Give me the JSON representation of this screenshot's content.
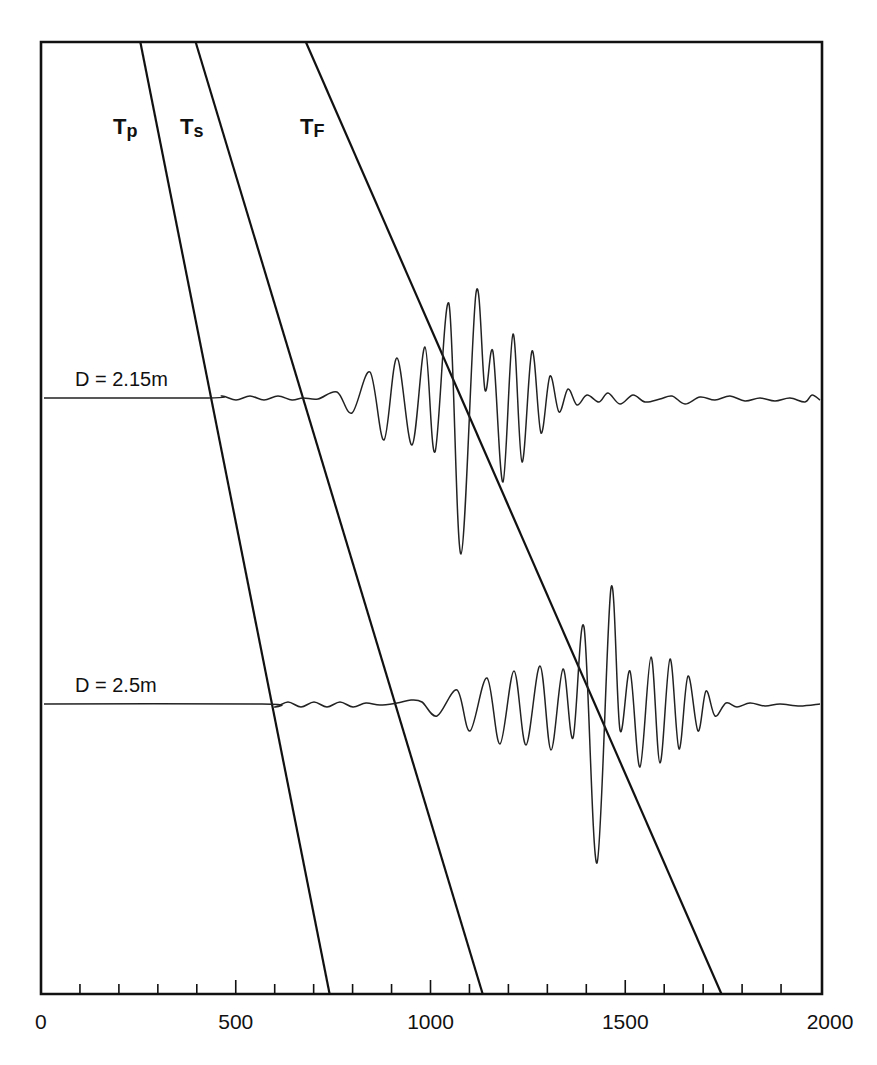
{
  "chart_data": {
    "type": "line",
    "title": "",
    "xlabel": "",
    "ylabel": "",
    "xlim": [
      0,
      2000
    ],
    "x_ticks": [
      0,
      500,
      1000,
      1500,
      2000
    ],
    "x_tick_labels": [
      "0",
      "500",
      "1000",
      "1500",
      "2000"
    ],
    "minor_tick_step": 100,
    "grid": false,
    "legend": null,
    "arrival_lines": [
      {
        "name": "Tp",
        "label_main": "T",
        "label_sub": "p",
        "x_top": 255,
        "x_bottom": 741
      },
      {
        "name": "Ts",
        "label_main": "T",
        "label_sub": "s",
        "x_top": 397,
        "x_bottom": 1134
      },
      {
        "name": "TF",
        "label_main": "T",
        "label_sub": "F",
        "x_top": 680,
        "x_bottom": 1747
      }
    ],
    "series": [
      {
        "name": "D = 2.15m",
        "label": "D = 2.15m",
        "baseline_px": 398,
        "points_px": [
          [
            44,
            398
          ],
          [
            208,
            398
          ],
          [
            222,
            396
          ],
          [
            236,
            400
          ],
          [
            250,
            396
          ],
          [
            264,
            400
          ],
          [
            278,
            396
          ],
          [
            292,
            400
          ],
          [
            303,
            398
          ],
          [
            318,
            399
          ],
          [
            337,
            392
          ],
          [
            352,
            413
          ],
          [
            370,
            372
          ],
          [
            384,
            440
          ],
          [
            397,
            358
          ],
          [
            412,
            445
          ],
          [
            425,
            347
          ],
          [
            435,
            452
          ],
          [
            449,
            304
          ],
          [
            461,
            554
          ],
          [
            476,
            293
          ],
          [
            485,
            390
          ],
          [
            493,
            352
          ],
          [
            503,
            482
          ],
          [
            513,
            334
          ],
          [
            522,
            462
          ],
          [
            532,
            351
          ],
          [
            541,
            433
          ],
          [
            550,
            376
          ],
          [
            559,
            412
          ],
          [
            568,
            389
          ],
          [
            577,
            405
          ],
          [
            587,
            395
          ],
          [
            599,
            402
          ],
          [
            608,
            393
          ],
          [
            620,
            404
          ],
          [
            633,
            395
          ],
          [
            645,
            402
          ],
          [
            660,
            399
          ],
          [
            672,
            396
          ],
          [
            685,
            404
          ],
          [
            700,
            397
          ],
          [
            715,
            400
          ],
          [
            730,
            396
          ],
          [
            745,
            401
          ],
          [
            760,
            398
          ],
          [
            775,
            401
          ],
          [
            790,
            398
          ],
          [
            805,
            402
          ],
          [
            812,
            395
          ],
          [
            820,
            400
          ]
        ]
      },
      {
        "name": "D = 2.5m",
        "label": "D = 2.5m",
        "baseline_px": 704,
        "points_px": [
          [
            44,
            704
          ],
          [
            262,
            704
          ],
          [
            275,
            707
          ],
          [
            288,
            702
          ],
          [
            301,
            707
          ],
          [
            314,
            702
          ],
          [
            327,
            707
          ],
          [
            340,
            702
          ],
          [
            353,
            707
          ],
          [
            366,
            703
          ],
          [
            380,
            705
          ],
          [
            397,
            703
          ],
          [
            411,
            700
          ],
          [
            422,
            702
          ],
          [
            437,
            716
          ],
          [
            457,
            690
          ],
          [
            470,
            731
          ],
          [
            487,
            678
          ],
          [
            500,
            744
          ],
          [
            514,
            671
          ],
          [
            526,
            745
          ],
          [
            540,
            666
          ],
          [
            551,
            750
          ],
          [
            563,
            669
          ],
          [
            573,
            738
          ],
          [
            584,
            627
          ],
          [
            597,
            863
          ],
          [
            611,
            588
          ],
          [
            620,
            730
          ],
          [
            630,
            671
          ],
          [
            640,
            767
          ],
          [
            651,
            657
          ],
          [
            660,
            763
          ],
          [
            670,
            659
          ],
          [
            679,
            749
          ],
          [
            688,
            676
          ],
          [
            698,
            731
          ],
          [
            706,
            691
          ],
          [
            715,
            716
          ],
          [
            726,
            703
          ],
          [
            737,
            707
          ],
          [
            750,
            703
          ],
          [
            765,
            706
          ],
          [
            780,
            704
          ],
          [
            800,
            706
          ],
          [
            820,
            704
          ]
        ]
      }
    ],
    "frame_px": {
      "left": 41,
      "right": 820,
      "top": 42,
      "bottom": 994
    }
  }
}
